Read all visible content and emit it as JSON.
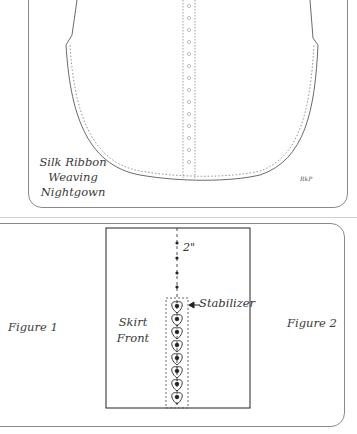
{
  "illustration": {
    "title_lines": [
      "Silk Ribbon",
      "Weaving",
      "Nightgown"
    ],
    "signature": "RkP"
  },
  "diagram": {
    "figure_left": "Figure 1",
    "figure_right": "Figure 2",
    "panel_label_lines": [
      "Skirt",
      "Front"
    ],
    "dimension": "2\"",
    "callout": "Stabilizer",
    "motif_count": 8
  },
  "colors": {
    "line": "#333333",
    "frame": "#8a8a8a",
    "background": "#ffffff"
  }
}
